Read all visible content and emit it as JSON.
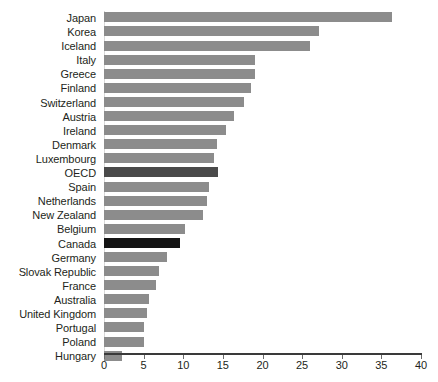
{
  "chart_data": {
    "type": "bar",
    "orientation": "horizontal",
    "title": "",
    "subtitle": "",
    "xlabel": "",
    "ylabel": "",
    "xlim": [
      0,
      40
    ],
    "xticks": [
      0,
      5,
      10,
      15,
      20,
      25,
      30,
      35,
      40
    ],
    "xtick_labels": [
      "0",
      "5",
      "10",
      "15",
      "20",
      "25",
      "30",
      "35",
      "40"
    ],
    "grid": false,
    "legend": false,
    "categories": [
      "Japan",
      "Korea",
      "Iceland",
      "Italy",
      "Greece",
      "Finland",
      "Switzerland",
      "Austria",
      "Ireland",
      "Denmark",
      "Luxembourg",
      "OECD",
      "Spain",
      "Netherlands",
      "New Zealand",
      "Belgium",
      "Canada",
      "Germany",
      "Slovak Republic",
      "France",
      "Australia",
      "United Kingdom",
      "Portugal",
      "Poland",
      "Hungary"
    ],
    "values": [
      36.3,
      27.1,
      26.0,
      19.0,
      19.0,
      18.5,
      17.7,
      16.4,
      15.4,
      14.3,
      13.9,
      14.4,
      13.3,
      13.0,
      12.5,
      10.2,
      9.6,
      8.0,
      7.0,
      6.6,
      5.7,
      5.4,
      5.1,
      5.1,
      2.3
    ],
    "bar_colors": {
      "default": "#8c8c8c",
      "OECD": "#4a4a4a",
      "Canada": "#141414"
    },
    "highlighted": [
      "OECD",
      "Canada"
    ]
  }
}
